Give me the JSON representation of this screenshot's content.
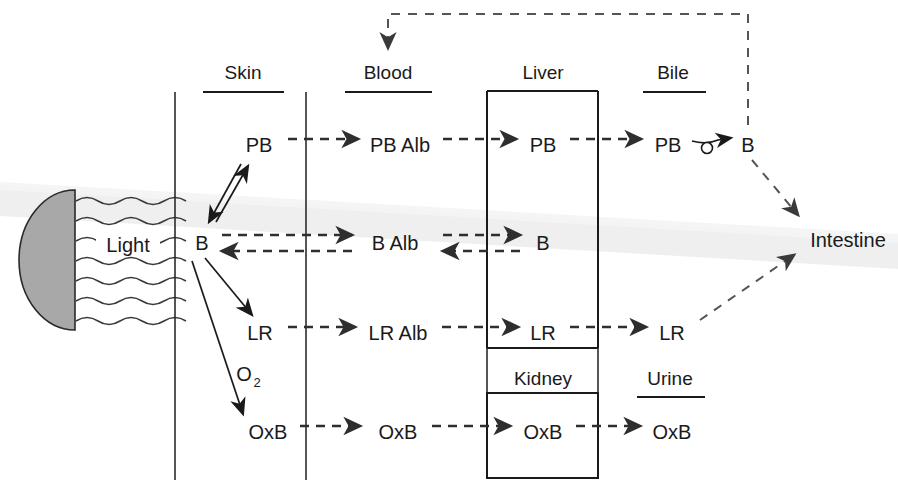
{
  "figure": {
    "background_color": "#ffffff",
    "ink_color": "#1a1a1a",
    "light_source_fill": "#a8a8a8"
  },
  "compartments": [
    {
      "id": "skin",
      "label": "Skin",
      "underline": true,
      "x": 243,
      "y": 79
    },
    {
      "id": "blood",
      "label": "Blood",
      "underline": true,
      "x": 388,
      "y": 79
    },
    {
      "id": "liver",
      "label": "Liver",
      "underline": false,
      "x": 543,
      "y": 79
    },
    {
      "id": "bile",
      "label": "Bile",
      "underline": true,
      "x": 673,
      "y": 79
    },
    {
      "id": "kidney",
      "label": "Kidney",
      "underline": false,
      "x": 543,
      "y": 377
    },
    {
      "id": "urine",
      "label": "Urine",
      "underline": true,
      "x": 670,
      "y": 377
    }
  ],
  "nodes": [
    {
      "id": "skin-pb",
      "label": "PB",
      "x": 259,
      "y": 145
    },
    {
      "id": "skin-b",
      "label": "B",
      "x": 202,
      "y": 243
    },
    {
      "id": "skin-lr",
      "label": "LR",
      "x": 260,
      "y": 333
    },
    {
      "id": "skin-o2",
      "label": "O",
      "sub": "2",
      "x": 252,
      "y": 372
    },
    {
      "id": "skin-oxb",
      "label": "OxB",
      "x": 268,
      "y": 432
    },
    {
      "id": "blood-pb-alb",
      "label": "PB Alb",
      "x": 400,
      "y": 145
    },
    {
      "id": "blood-b-alb",
      "label": "B Alb",
      "x": 393,
      "y": 243
    },
    {
      "id": "blood-lr-alb",
      "label": "LR Alb",
      "x": 398,
      "y": 333
    },
    {
      "id": "blood-oxb",
      "label": "OxB",
      "x": 398,
      "y": 432
    },
    {
      "id": "liver-pb",
      "label": "PB",
      "x": 543,
      "y": 145
    },
    {
      "id": "liver-b",
      "label": "B",
      "x": 543,
      "y": 243
    },
    {
      "id": "liver-lr",
      "label": "LR",
      "x": 543,
      "y": 333
    },
    {
      "id": "kidney-oxb",
      "label": "OxB",
      "x": 543,
      "y": 432
    },
    {
      "id": "bile-pb",
      "label": "PB",
      "x": 668,
      "y": 145
    },
    {
      "id": "bile-b",
      "label": "B",
      "x": 748,
      "y": 145
    },
    {
      "id": "bile-lr",
      "label": "LR",
      "x": 672,
      "y": 333
    },
    {
      "id": "urine-oxb",
      "label": "OxB",
      "x": 672,
      "y": 432
    },
    {
      "id": "light",
      "label": "Light",
      "x": 128,
      "y": 245
    },
    {
      "id": "intestine",
      "label": "Intestine",
      "x": 848,
      "y": 240
    }
  ],
  "edges": [
    {
      "id": "pb-row-skin-to-blood",
      "style": "dashed",
      "from": "skin-pb",
      "to": "blood-pb-alb"
    },
    {
      "id": "pb-row-blood-to-liver",
      "style": "dashed",
      "from": "blood-pb-alb",
      "to": "liver-pb"
    },
    {
      "id": "pb-row-liver-to-bile",
      "style": "dashed",
      "from": "liver-pb",
      "to": "bile-pb"
    },
    {
      "id": "pb-to-b-reaction",
      "style": "solid-with-circle",
      "from": "bile-pb",
      "to": "bile-b"
    },
    {
      "id": "b-row-skin-to-blood",
      "style": "dashed-bidirectional",
      "from": "skin-b",
      "to": "blood-b-alb"
    },
    {
      "id": "b-row-blood-to-liver",
      "style": "dashed-bidirectional",
      "from": "blood-b-alb",
      "to": "liver-b"
    },
    {
      "id": "lr-row-skin-to-blood",
      "style": "dashed",
      "from": "skin-lr",
      "to": "blood-lr-alb"
    },
    {
      "id": "lr-row-blood-to-liver",
      "style": "dashed",
      "from": "blood-lr-alb",
      "to": "liver-lr"
    },
    {
      "id": "lr-row-liver-to-bile",
      "style": "dashed",
      "from": "liver-lr",
      "to": "bile-lr"
    },
    {
      "id": "oxb-row-skin-to-blood",
      "style": "dashed",
      "from": "skin-oxb",
      "to": "blood-oxb"
    },
    {
      "id": "oxb-row-blood-to-kidney",
      "style": "dashed",
      "from": "blood-oxb",
      "to": "kidney-oxb"
    },
    {
      "id": "oxb-row-kidney-to-urine",
      "style": "dashed",
      "from": "kidney-oxb",
      "to": "urine-oxb"
    },
    {
      "id": "skin-pb-b-exchange",
      "style": "solid-bidirectional",
      "from": "skin-pb",
      "to": "skin-b"
    },
    {
      "id": "skin-b-to-lr",
      "style": "solid",
      "from": "skin-b",
      "to": "skin-lr"
    },
    {
      "id": "skin-b-to-oxb",
      "style": "solid",
      "from": "skin-b",
      "to": "skin-oxb"
    },
    {
      "id": "bile-b-to-intestine",
      "style": "dashed",
      "from": "bile-b",
      "to": "intestine"
    },
    {
      "id": "bile-lr-to-intestine",
      "style": "dashed",
      "from": "bile-lr",
      "to": "intestine"
    },
    {
      "id": "enterohepatic-feedback",
      "style": "dashed",
      "from": "bile-b",
      "to": "blood"
    }
  ],
  "organ_boxes": [
    {
      "id": "liver-box",
      "x": 487,
      "y": 91,
      "width": 111,
      "height": 257,
      "sides": "left-right-top-bottom-open-rows"
    },
    {
      "id": "kidney-box",
      "x": 487,
      "y": 393,
      "width": 111,
      "height": 85,
      "sides": "all"
    }
  ],
  "dividers": [
    {
      "id": "skin-left-boundary",
      "x": 175
    },
    {
      "id": "skin-blood-boundary",
      "x": 306
    },
    {
      "id": "blood-liver-boundary",
      "x": 487
    },
    {
      "id": "liver-bile-boundary",
      "x": 598
    }
  ],
  "light_source": {
    "id": "phototherapy-lamp",
    "shape": "half-disk",
    "ray_count": 7,
    "ray_label": "Light"
  }
}
